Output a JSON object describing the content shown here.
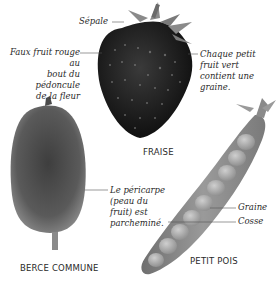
{
  "figures": {
    "strawberry": {
      "caption": "FRAISE",
      "labels": {
        "sepal": "Sépale",
        "false_fruit": [
          "Faux fruit rouge au",
          "bout du pédoncule",
          "de la fleur"
        ],
        "achene": [
          "Chaque petit",
          "fruit vert",
          "contient une",
          "graine."
        ]
      }
    },
    "hogweed": {
      "caption": "BERCE COMMUNE",
      "labels": {
        "pericarp": [
          "Le péricarpe",
          "(peau du",
          "fruit) est",
          "parcheminé."
        ]
      }
    },
    "pea": {
      "caption": "PETIT POIS",
      "labels": {
        "seed": "Graine",
        "pod": "Cosse"
      }
    }
  }
}
